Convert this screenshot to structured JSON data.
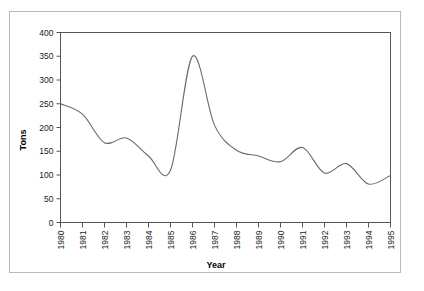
{
  "figure": {
    "background_color": "#ffffff",
    "frame_color": "#b9b9b9",
    "axis_color": "#555555",
    "line_color": "#6b6b6b"
  },
  "chart_data": {
    "type": "line",
    "title": "",
    "xlabel": "Year",
    "ylabel": "Tons",
    "grid": false,
    "legend": false,
    "xlim": [
      1980,
      1995
    ],
    "ylim": [
      0,
      400
    ],
    "xticks": [
      "1980",
      "1981",
      "1982",
      "1983",
      "1984",
      "1985",
      "1986",
      "1987",
      "1988",
      "1989",
      "1990",
      "1991",
      "1992",
      "1993",
      "1994",
      "1995"
    ],
    "yticks": [
      "0",
      "50",
      "100",
      "150",
      "200",
      "250",
      "300",
      "350",
      "400"
    ],
    "x": [
      1980,
      1981,
      1982,
      1983,
      1984,
      1985,
      1986,
      1987,
      1988,
      1989,
      1990,
      1991,
      1992,
      1993,
      1994,
      1995
    ],
    "series": [
      {
        "name": "Tons",
        "values": [
          250,
          228,
          168,
          178,
          140,
          110,
          350,
          205,
          152,
          140,
          128,
          158,
          104,
          124,
          81,
          99
        ]
      }
    ]
  },
  "axis": {
    "y_label": "Tons",
    "x_label": "Year",
    "y_ticks": [
      "400",
      "350",
      "300",
      "250",
      "200",
      "150",
      "100",
      "50",
      "0"
    ],
    "x_ticks": [
      "1980",
      "1981",
      "1982",
      "1983",
      "1984",
      "1985",
      "1986",
      "1987",
      "1988",
      "1989",
      "1990",
      "1991",
      "1992",
      "1993",
      "1994",
      "1995"
    ]
  }
}
